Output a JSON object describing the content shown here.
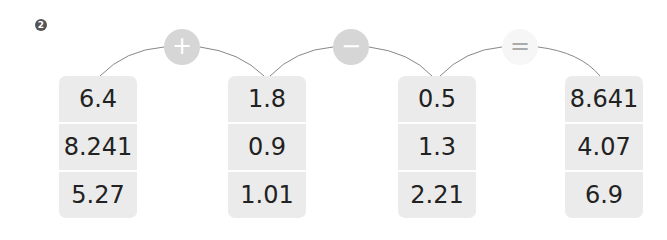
{
  "question_number": "2",
  "operators": [
    {
      "symbol": "+",
      "name": "plus",
      "bg": "#d6d6d6"
    },
    {
      "symbol": "−",
      "name": "minus",
      "bg": "#d6d6d6"
    },
    {
      "symbol": "=",
      "name": "equals",
      "bg": "#f6f6f6"
    }
  ],
  "columns": [
    {
      "values": [
        "6.4",
        "8.241",
        "5.27"
      ]
    },
    {
      "values": [
        "1.8",
        "0.9",
        "1.01"
      ]
    },
    {
      "values": [
        "0.5",
        "1.3",
        "2.21"
      ]
    },
    {
      "values": [
        "8.641",
        "4.07",
        "6.9"
      ]
    }
  ]
}
